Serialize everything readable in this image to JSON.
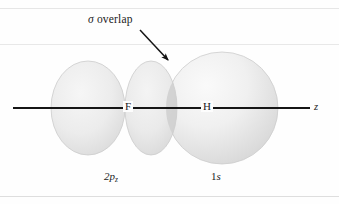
{
  "figure": {
    "kind": "orbital-overlap-diagram",
    "molecule": "HF",
    "width": 339,
    "height": 204,
    "background_color": "#fefefe",
    "ink_color": "#1b1b1b",
    "orbital_fill_color": "#e9e9e9",
    "orbital_edge_color": "#c9c9c9",
    "overlap_fill_color": "#d2d2d2"
  },
  "annotation": {
    "sigma_symbol": "σ",
    "overlap_text": "overlap",
    "arrow": {
      "name": "overlap-pointer-arrow",
      "from_x": 140,
      "from_y": 30,
      "to_x": 170,
      "to_y": 62
    }
  },
  "axis": {
    "label": "z",
    "line_y": 108,
    "line_start_x": 13,
    "line_end_x": 310
  },
  "atoms": [
    {
      "symbol": "F",
      "x": 128,
      "y": 108
    },
    {
      "symbol": "H",
      "x": 205,
      "y": 108
    }
  ],
  "orbitals": [
    {
      "name": "fluorine-2pz-orbital",
      "label_base": "2p",
      "label_sub": "z",
      "type": "p",
      "atom": "F",
      "lobes": [
        {
          "name": "left-lobe",
          "cx": 88,
          "cy": 108,
          "rx": 37,
          "ry": 47
        },
        {
          "name": "right-lobe",
          "cx": 151,
          "cy": 108,
          "rx": 26,
          "ry": 47
        }
      ]
    },
    {
      "name": "hydrogen-1s-orbital",
      "label_base": "1",
      "label_sub": "s",
      "type": "s",
      "atom": "H",
      "sphere": {
        "cx": 222,
        "cy": 108,
        "r": 56
      }
    }
  ]
}
